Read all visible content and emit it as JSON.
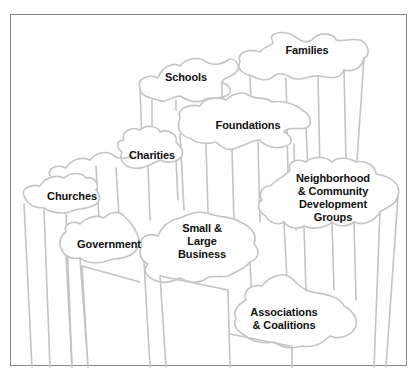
{
  "diagram": {
    "type": "puzzle-pillars",
    "colors": {
      "outline": "#c4c4c4",
      "text": "#111111",
      "frame": "#8a8a8a",
      "background": "#ffffff"
    },
    "pieces": [
      {
        "id": "families",
        "lines": [
          "Families"
        ]
      },
      {
        "id": "schools",
        "lines": [
          "Schools"
        ]
      },
      {
        "id": "foundations",
        "lines": [
          "Foundations"
        ]
      },
      {
        "id": "charities",
        "lines": [
          "Charities"
        ]
      },
      {
        "id": "churches",
        "lines": [
          "Churches"
        ]
      },
      {
        "id": "neighborhood",
        "lines": [
          "Neighborhood",
          "& Community",
          "Development",
          "Groups"
        ]
      },
      {
        "id": "government",
        "lines": [
          "Government"
        ]
      },
      {
        "id": "business",
        "lines": [
          "Small &",
          "Large",
          "Business"
        ]
      },
      {
        "id": "associations",
        "lines": [
          "Associations",
          "& Coalitions"
        ]
      }
    ]
  }
}
